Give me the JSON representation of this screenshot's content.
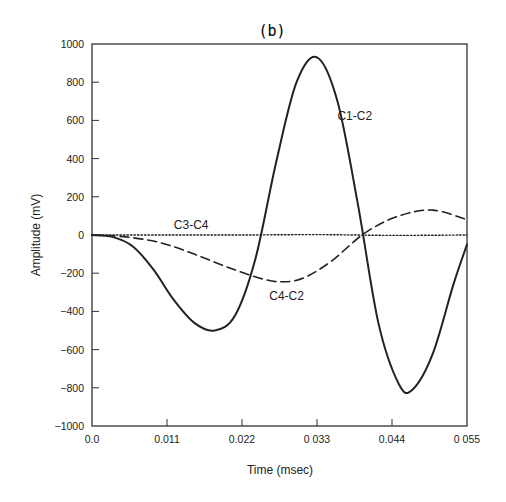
{
  "chart_data": {
    "type": "line",
    "title": "(b)",
    "xlabel": "Time (msec)",
    "ylabel": "Amplitude (mV)",
    "xlim": [
      0.0,
      0.055
    ],
    "ylim": [
      -1000,
      1000
    ],
    "xticks": [
      0.0,
      0.011,
      0.022,
      0.033,
      0.044,
      0.055
    ],
    "xtick_labels": [
      "0.0",
      "0.011",
      "0.022",
      "0 033",
      "0.044",
      "0 055"
    ],
    "yticks": [
      1000,
      800,
      600,
      400,
      200,
      0,
      -200,
      -400,
      -600,
      -800,
      -1000
    ],
    "ytick_labels": [
      "1000",
      "800",
      "600",
      "400",
      "200",
      "0",
      "-200",
      "-400",
      "-600",
      "-800",
      "-1000"
    ],
    "grid": false,
    "legend": "inline labels",
    "series": [
      {
        "name": "C1-C2",
        "style": "solid",
        "x": [
          0.0,
          0.003,
          0.006,
          0.009,
          0.012,
          0.015,
          0.018,
          0.021,
          0.024,
          0.027,
          0.03,
          0.033,
          0.036,
          0.039,
          0.042,
          0.045,
          0.047,
          0.05,
          0.053,
          0.055
        ],
        "y": [
          0,
          -10,
          -60,
          -180,
          -340,
          -460,
          -500,
          -420,
          -120,
          380,
          800,
          930,
          700,
          160,
          -460,
          -780,
          -810,
          -620,
          -260,
          -50
        ]
      },
      {
        "name": "C4-C2",
        "style": "dashed",
        "x": [
          0.0,
          0.005,
          0.01,
          0.015,
          0.02,
          0.025,
          0.028,
          0.031,
          0.035,
          0.04,
          0.045,
          0.05,
          0.055
        ],
        "y": [
          0,
          -10,
          -40,
          -100,
          -170,
          -230,
          -245,
          -225,
          -140,
          10,
          100,
          130,
          80
        ]
      },
      {
        "name": "C3-C4",
        "style": "dotted",
        "x": [
          0.0,
          0.011,
          0.022,
          0.033,
          0.044,
          0.055
        ],
        "y": [
          0,
          0,
          0,
          2,
          -2,
          0
        ]
      }
    ],
    "annotations": [
      {
        "text": "C1-C2",
        "x": 0.036,
        "y": 600
      },
      {
        "text": "C3-C4",
        "x": 0.012,
        "y": 30
      },
      {
        "text": "C4-C2",
        "x": 0.026,
        "y": -340
      }
    ]
  }
}
